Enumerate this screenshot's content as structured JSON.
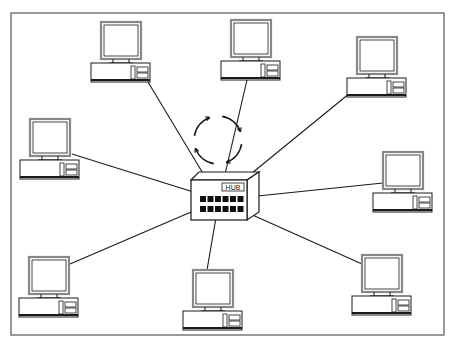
{
  "diagram": {
    "type": "star-network-topology",
    "hub": {
      "label": "HUB",
      "ports_rows": 2,
      "ports_per_row": 6,
      "x": 191,
      "y": 180,
      "w": 56,
      "h": 40
    },
    "rotation_indicator": {
      "icon": "circular-arrows-icon",
      "cx": 218,
      "cy": 140,
      "r": 24
    },
    "nodes": [
      {
        "id": "pc-top-left",
        "mx": 101,
        "my": 22,
        "link_x": 148,
        "link_y": 82
      },
      {
        "id": "pc-top-center",
        "mx": 231,
        "my": 20,
        "link_x": 247,
        "link_y": 80
      },
      {
        "id": "pc-top-right",
        "mx": 357,
        "my": 37,
        "link_x": 350,
        "link_y": 93
      },
      {
        "id": "pc-left",
        "mx": 30,
        "my": 119,
        "link_x": 72,
        "link_y": 154
      },
      {
        "id": "pc-right",
        "mx": 383,
        "my": 152,
        "link_x": 383,
        "link_y": 183
      },
      {
        "id": "pc-bottom-left",
        "mx": 29,
        "my": 257,
        "link_x": 70,
        "link_y": 264
      },
      {
        "id": "pc-bottom-center",
        "mx": 193,
        "my": 270,
        "link_x": 207,
        "link_y": 270
      },
      {
        "id": "pc-bottom-right",
        "mx": 362,
        "my": 255,
        "link_x": 362,
        "link_y": 264
      }
    ],
    "colors": {
      "line": "#1a1a1a",
      "frame": "#555555",
      "monitor_outer": "#888888",
      "fill": "#ffffff",
      "port": "#111111"
    }
  }
}
